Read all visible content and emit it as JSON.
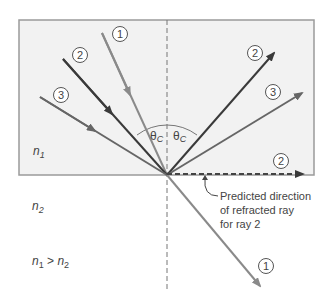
{
  "diagram": {
    "medium_top": {
      "label": "n",
      "sub": "1",
      "fill": "#f2f2f2"
    },
    "medium_bottom": {
      "label": "n",
      "sub": "2"
    },
    "condition": {
      "a": "n",
      "a_sub": "1",
      "op": " > ",
      "b": "n",
      "b_sub": "2"
    },
    "angle_labels": [
      "θ",
      "θ"
    ],
    "angle_sub": "C",
    "rays": [
      {
        "id": "1",
        "label": "1",
        "incident_color": "#8a8a8a",
        "behavior": "refracted"
      },
      {
        "id": "2",
        "label": "2",
        "incident_color": "#3a3a3a",
        "behavior": "reflected at critical angle"
      },
      {
        "id": "3",
        "label": "3",
        "incident_color": "#666666",
        "behavior": "totally reflected"
      }
    ],
    "annotation": {
      "line1": "Predicted direction",
      "line2": "of refracted ray",
      "line3": "for ray 2"
    },
    "colors": {
      "ray_light": "#8a8a8a",
      "ray_dark": "#3a3a3a",
      "ray_mid": "#666666",
      "border": "#9a9a9a",
      "text": "#444444"
    }
  }
}
